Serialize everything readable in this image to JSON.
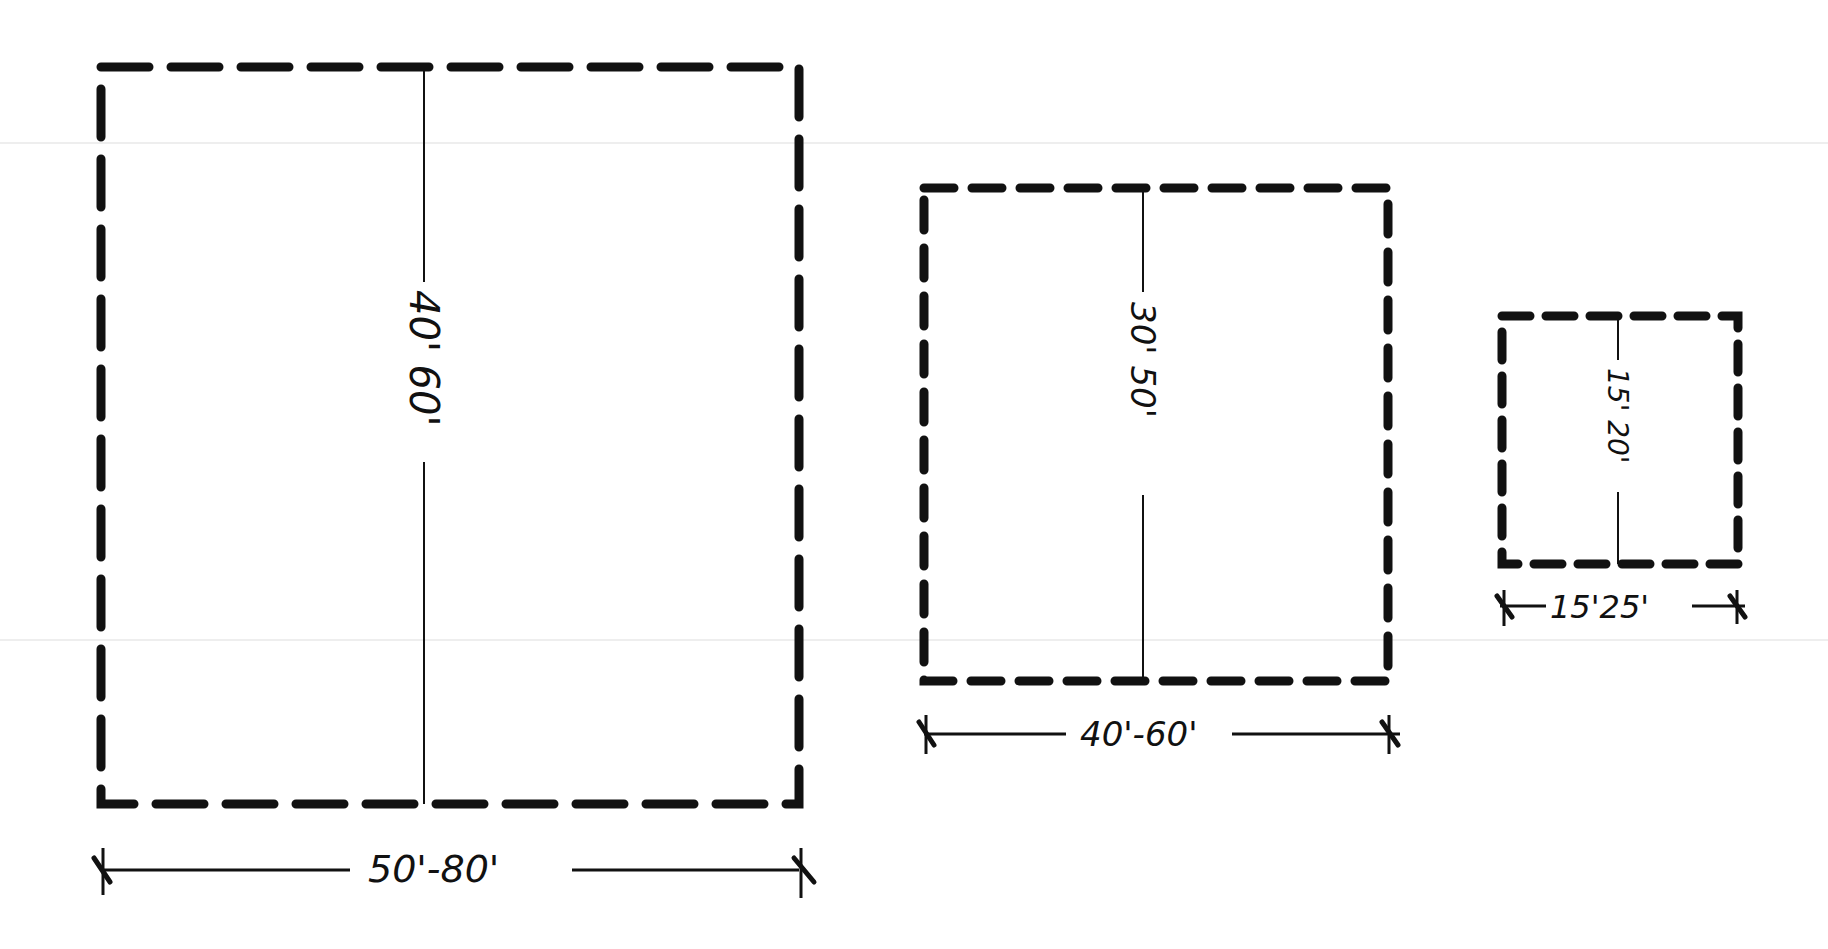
{
  "diagram": {
    "title": "",
    "colors": {
      "ink": "#111111",
      "paper": "#ffffff",
      "scan_artifact": "#eeeeee"
    },
    "boxes": [
      {
        "id": "large",
        "depth_label": "40' 60'",
        "width_label": "50'-80'",
        "rect": {
          "x": 101,
          "y": 67,
          "w": 698,
          "h": 737
        },
        "center_x": 424,
        "depth_label_gap": [
          285,
          460
        ],
        "dim_y": 870,
        "dim_gap": [
          350,
          570
        ],
        "dash": "48 22"
      },
      {
        "id": "medium",
        "depth_label": "30' 50'",
        "width_label": "40'-60'",
        "rect": {
          "x": 924,
          "y": 188,
          "w": 464,
          "h": 493
        },
        "center_x": 1143,
        "depth_label_gap": [
          290,
          495
        ],
        "dim_y": 734,
        "dim_gap": [
          1068,
          1230
        ],
        "dash": "30 18"
      },
      {
        "id": "small",
        "depth_label": "15' 20'",
        "width_label": "15'25'",
        "rect": {
          "x": 1502,
          "y": 316,
          "w": 236,
          "h": 248
        },
        "center_x": 1618,
        "depth_label_gap": [
          362,
          492
        ],
        "dim_y": 606,
        "dim_gap": [
          1548,
          1690
        ],
        "dash": "28 16"
      }
    ]
  }
}
